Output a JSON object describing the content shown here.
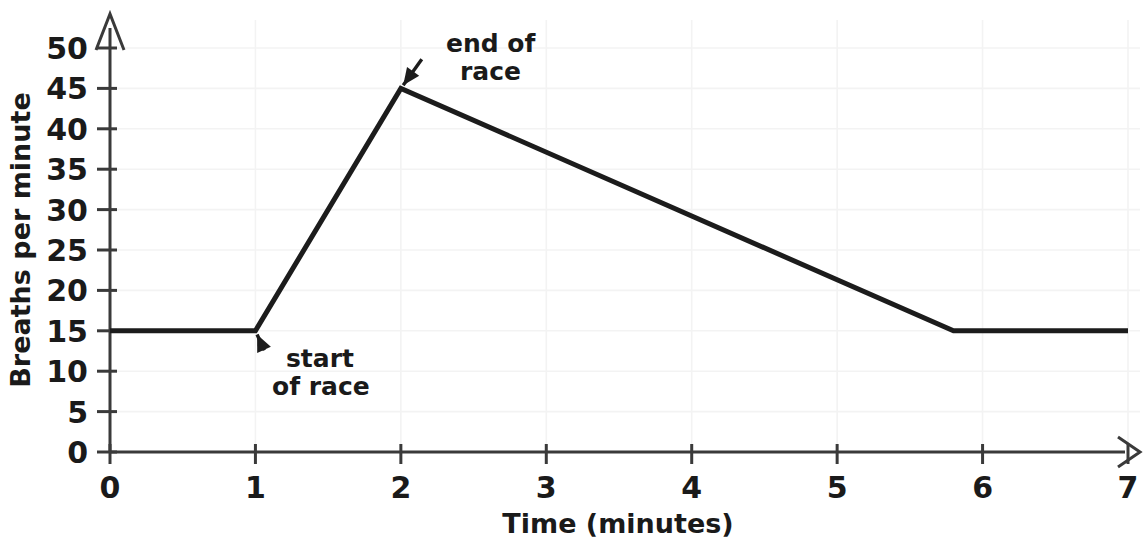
{
  "chart_data": {
    "type": "line",
    "title": "",
    "xlabel": "Time (minutes)",
    "ylabel": "Breaths per minute",
    "xlim": [
      0,
      7
    ],
    "ylim": [
      0,
      50
    ],
    "grid": true,
    "legend": "none",
    "xticks": [
      "0",
      "1",
      "2",
      "3",
      "4",
      "5",
      "6",
      "7"
    ],
    "xtick_values": [
      0,
      1,
      2,
      3,
      4,
      5,
      6,
      7
    ],
    "yticks": [
      "0",
      "5",
      "10",
      "15",
      "20",
      "25",
      "30",
      "35",
      "40",
      "45",
      "50"
    ],
    "ytick_values": [
      0,
      5,
      10,
      15,
      20,
      25,
      30,
      35,
      40,
      45,
      50
    ],
    "series": [
      {
        "name": "breathing rate",
        "x": [
          0,
          1,
          2,
          5.8,
          7
        ],
        "values": [
          15,
          15,
          45,
          15,
          15
        ],
        "color": "#1c1c1c"
      }
    ],
    "annotations": [
      {
        "id": "start-of-race",
        "text_line1": "start",
        "text_line2": "of race",
        "point_x": 1,
        "point_y": 15,
        "label_x": 1.1,
        "label_y": 11
      },
      {
        "id": "end-of-race",
        "text_line1": "end of",
        "text_line2": "race",
        "point_x": 2,
        "point_y": 45,
        "label_x": 2.2,
        "label_y": 50
      }
    ]
  },
  "axes": {
    "x_title": "Time (minutes)",
    "y_title": "Breaths per minute"
  },
  "colors": {
    "line": "#1c1c1c",
    "axis": "#3a3a3a",
    "grid": "#f3f3f3",
    "text": "#1a1a1a",
    "background": "#ffffff"
  }
}
